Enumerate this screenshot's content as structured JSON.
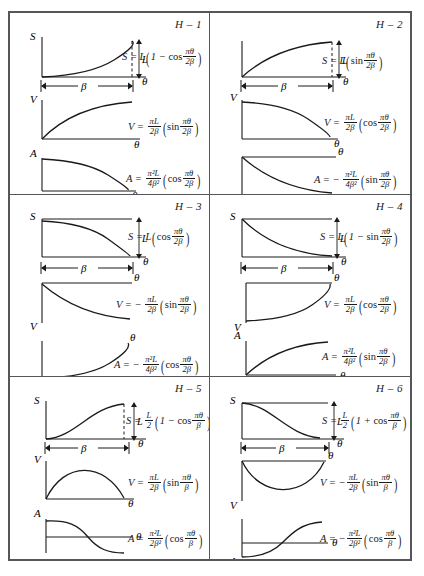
{
  "sheet": {
    "title": "Harmonic cam motion curves H-1 through H-6",
    "axis_labels": {
      "s": "S",
      "v": "V",
      "a": "A",
      "theta": "θ",
      "beta": "β",
      "lift": "L"
    }
  },
  "cells": [
    {
      "id": "H-1",
      "tag": "H – 1",
      "s": {
        "label": "S",
        "shape": "rising-concave-up",
        "desc": "half-harmonic rise, zero slope at start"
      },
      "v": {
        "label": "V",
        "shape": "rising-concave-down",
        "desc": "quarter sine rising to max"
      },
      "a": {
        "label": "A",
        "shape": "falling-from-max",
        "desc": "quarter cosine falling to zero"
      },
      "eq_s": {
        "lhs": "S",
        "coef": "L",
        "sign": "",
        "inner_sign": "1 − ",
        "fn": "cos",
        "num": "πθ",
        "den": "2β"
      },
      "eq_v": {
        "lhs": "V",
        "sign": "",
        "cn": "πL",
        "cd": "2β",
        "fn": "sin",
        "num": "πθ",
        "den": "2β"
      },
      "eq_a": {
        "lhs": "A",
        "sign": "",
        "cn": "π²L",
        "cd": "4β²",
        "fn": "cos",
        "num": "πθ",
        "den": "2β"
      }
    },
    {
      "id": "H-2",
      "tag": "H – 2",
      "s": {
        "label": "S",
        "shape": "rising-concave-down",
        "desc": "quarter sine rise, zero slope at end"
      },
      "v": {
        "label": "V",
        "shape": "falling-concave-down",
        "desc": "quarter cosine falling to zero"
      },
      "a": {
        "label": "A",
        "shape": "negative-decreasing",
        "desc": "negative quarter sine below axis"
      },
      "eq_s": {
        "lhs": "S",
        "coef": "L",
        "sign": "",
        "inner_sign": "",
        "fn": "sin",
        "num": "πθ",
        "den": "2β"
      },
      "eq_v": {
        "lhs": "V",
        "sign": "",
        "cn": "πL",
        "cd": "2β",
        "fn": "cos",
        "num": "πθ",
        "den": "2β"
      },
      "eq_a": {
        "lhs": "A",
        "sign": "−",
        "cn": "π²L",
        "cd": "4β²",
        "fn": "sin",
        "num": "πθ",
        "den": "2β"
      }
    },
    {
      "id": "H-3",
      "tag": "H – 3",
      "s": {
        "label": "S",
        "shape": "falling-concave-down",
        "desc": "quarter cosine fall from L to 0"
      },
      "v": {
        "label": "V",
        "shape": "negative-decreasing",
        "desc": "negative quarter sine below axis"
      },
      "a": {
        "label": "A",
        "shape": "negative-rising",
        "desc": "negative cosine rising toward zero"
      },
      "eq_s": {
        "lhs": "S",
        "coef": "L",
        "sign": "",
        "inner_sign": "",
        "fn": "cos",
        "num": "πθ",
        "den": "2β"
      },
      "eq_v": {
        "lhs": "V",
        "sign": "−",
        "cn": "πL",
        "cd": "2β",
        "fn": "sin",
        "num": "πθ",
        "den": "2β"
      },
      "eq_a": {
        "lhs": "A",
        "sign": "−",
        "cn": "π²L",
        "cd": "4β²",
        "fn": "cos",
        "num": "πθ",
        "den": "2β"
      }
    },
    {
      "id": "H-4",
      "tag": "H – 4",
      "s": {
        "label": "S",
        "shape": "falling-concave-up",
        "desc": "harmonic fall from L, zero slope at end"
      },
      "v": {
        "label": "V",
        "shape": "negative-rising",
        "desc": "negative cosine rising to zero"
      },
      "a": {
        "label": "A",
        "shape": "rising-concave-down",
        "desc": "quarter sine rising to max"
      },
      "eq_s": {
        "lhs": "S",
        "coef": "L",
        "sign": "",
        "inner_sign": "1 − ",
        "fn": "sin",
        "num": "πθ",
        "den": "2β"
      },
      "eq_v": {
        "lhs": "V",
        "sign": "",
        "cn": "πL",
        "cd": "2β",
        "fn": "cos",
        "num": "πθ",
        "den": "2β"
      },
      "eq_a": {
        "lhs": "A",
        "sign": "",
        "cn": "π²L",
        "cd": "4β²",
        "fn": "sin",
        "num": "πθ",
        "den": "2β"
      }
    },
    {
      "id": "H-5",
      "tag": "H – 5",
      "s": {
        "label": "S",
        "shape": "s-curve-rise",
        "desc": "full harmonic rise, S shaped"
      },
      "v": {
        "label": "V",
        "shape": "half-sine-hump",
        "desc": "half sine arch, positive"
      },
      "a": {
        "label": "A",
        "shape": "cosine-crossing",
        "desc": "cosine from max through zero to min"
      },
      "eq_s": {
        "lhs": "S",
        "coef_frac": {
          "n": "L",
          "d": "2"
        },
        "sign": "",
        "inner_sign": "1 − ",
        "fn": "cos",
        "num": "πθ",
        "den": "β"
      },
      "eq_v": {
        "lhs": "V",
        "sign": "",
        "cn": "πL",
        "cd": "2β",
        "fn": "sin",
        "num": "πθ",
        "den": "β"
      },
      "eq_a": {
        "lhs": "A",
        "sign": "",
        "cn": "π²L",
        "cd": "2β²",
        "fn": "cos",
        "num": "πθ",
        "den": "β"
      }
    },
    {
      "id": "H-6",
      "tag": "H – 6",
      "s": {
        "label": "S",
        "shape": "s-curve-fall",
        "desc": "full harmonic fall, S shaped"
      },
      "v": {
        "label": "V",
        "shape": "half-sine-dip",
        "desc": "half sine trough, negative"
      },
      "a": {
        "label": "A",
        "shape": "cosine-crossing-up",
        "desc": "cosine from min through zero to max"
      },
      "eq_s": {
        "lhs": "S",
        "coef_frac": {
          "n": "L",
          "d": "2"
        },
        "sign": "",
        "inner_sign": "1 + ",
        "fn": "cos",
        "num": "πθ",
        "den": "β"
      },
      "eq_v": {
        "lhs": "V",
        "sign": "−",
        "cn": "πL",
        "cd": "2β",
        "fn": "sin",
        "num": "πθ",
        "den": "β"
      },
      "eq_a": {
        "lhs": "A",
        "sign": "−",
        "cn": "π²L",
        "cd": "2β²",
        "fn": "cos",
        "num": "πθ",
        "den": "β"
      }
    }
  ]
}
